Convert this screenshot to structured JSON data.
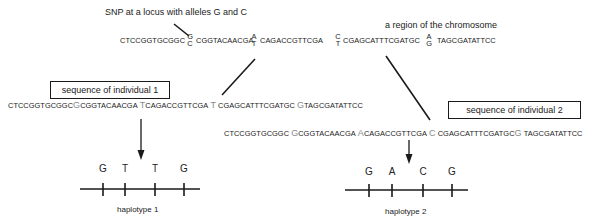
{
  "figure": {
    "snp_annotation": "SNP at a locus with alleles G and C",
    "region_label": "a region of the chromosome",
    "chromosome": {
      "segments": [
        "CTCCGGTGCGGC",
        "CGGTACAACGA",
        "CAGACCGTTCGA",
        "CGAGCATTTCGATGC",
        "TAGCGATATTCC"
      ],
      "snp_alleles": [
        {
          "top": "G",
          "bottom": "C"
        },
        {
          "top": "A",
          "bottom": "T"
        },
        {
          "top": "C",
          "bottom": "T"
        },
        {
          "top": "A",
          "bottom": "G"
        }
      ]
    },
    "individual_1": {
      "box_label": "sequence of individual 1",
      "segments": [
        "CTCCGGTGCGGC",
        "CGGTACAACGA",
        "CAGACCGTTCGA",
        "CGAGCATTTCGATGC",
        "TAGCGATATTCC"
      ],
      "alleles": [
        "G",
        "T",
        "T",
        "G"
      ],
      "haplotype_label": "haplotype 1"
    },
    "individual_2": {
      "box_label": "sequence of individual 2",
      "segments": [
        "CTCCGGTGCGGC",
        "CGGTACAACGA",
        "CAGACCGTTCGA",
        "CGAGCATTTCGATGC",
        "TAGCGATATTCC"
      ],
      "alleles": [
        "G",
        "A",
        "C",
        "G"
      ],
      "haplotype_label": "haplotype 2"
    },
    "colors": {
      "text": "#222222",
      "snp_highlight": "#8a8a8a",
      "lines": "#1a1a1a"
    }
  }
}
